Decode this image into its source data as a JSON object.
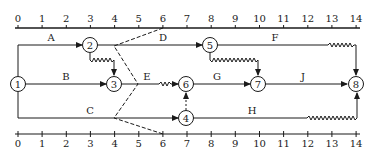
{
  "diagram": {
    "type": "time-scaled network diagram",
    "time_axis": {
      "ticks": [
        "0",
        "1",
        "2",
        "3",
        "4",
        "5",
        "6",
        "7",
        "8",
        "9",
        "10",
        "11",
        "12",
        "13",
        "14"
      ]
    },
    "nodes": [
      {
        "id": "1",
        "label": "1"
      },
      {
        "id": "2",
        "label": "2"
      },
      {
        "id": "3",
        "label": "3"
      },
      {
        "id": "4",
        "label": "4"
      },
      {
        "id": "5",
        "label": "5"
      },
      {
        "id": "6",
        "label": "6"
      },
      {
        "id": "7",
        "label": "7"
      },
      {
        "id": "8",
        "label": "8"
      }
    ],
    "activities": [
      {
        "label": "A",
        "from": "1",
        "to": "2",
        "start": 0,
        "end": 3
      },
      {
        "label": "B",
        "from": "1",
        "to": "3",
        "start": 0,
        "end": 4
      },
      {
        "label": "C",
        "from": "1",
        "to": "4",
        "start": 0,
        "end": 7
      },
      {
        "label": "D",
        "from": "2",
        "to": "5",
        "start": 3,
        "end": 8
      },
      {
        "label": "E",
        "from": "3",
        "to": "6",
        "start": 4,
        "end": 7
      },
      {
        "label": "F",
        "from": "5",
        "to": "8",
        "start": 8,
        "end": 14
      },
      {
        "label": "G",
        "from": "6",
        "to": "7",
        "start": 7,
        "end": 10
      },
      {
        "label": "H",
        "from": "4",
        "to": "8",
        "start": 7,
        "end": 14
      },
      {
        "label": "J",
        "from": "7",
        "to": "8",
        "start": 10,
        "end": 14
      }
    ],
    "dummies": [
      {
        "from": "2",
        "to": "3"
      },
      {
        "from": "5",
        "to": "7"
      },
      {
        "from": "4",
        "to": "6"
      }
    ],
    "check_line": {
      "points": [
        "6 (top)",
        "4",
        "5",
        "4",
        "6 (bottom)"
      ]
    }
  }
}
